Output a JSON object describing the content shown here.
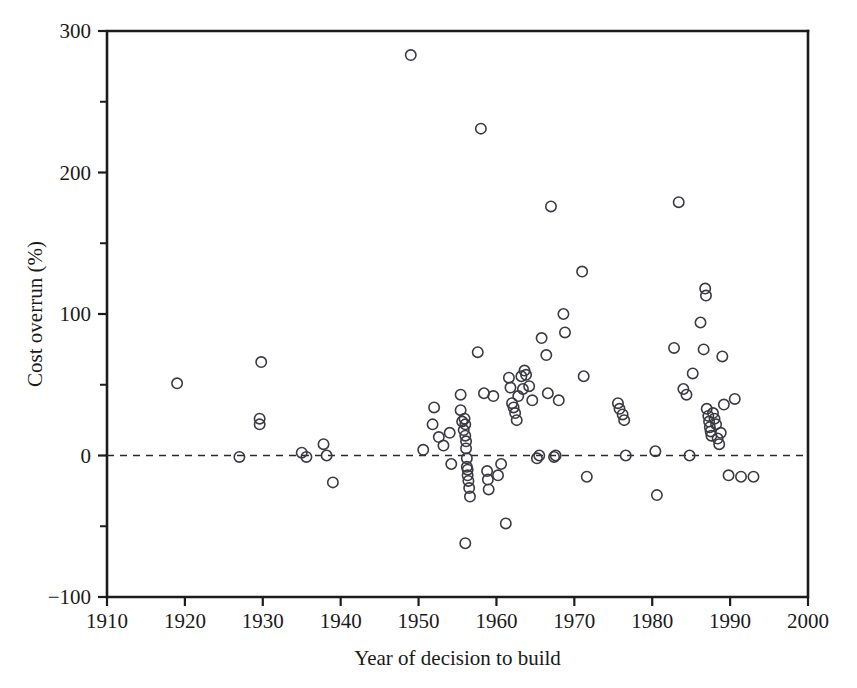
{
  "chart_data": {
    "type": "scatter",
    "title": "",
    "xlabel": "Year of decision to build",
    "ylabel": "Cost overrun (%)",
    "xlim": [
      1910,
      2000
    ],
    "ylim": [
      -100,
      300
    ],
    "xticks": [
      1910,
      1920,
      1930,
      1940,
      1950,
      1960,
      1970,
      1980,
      1990,
      2000
    ],
    "xtick_labels": [
      "1910",
      "1920",
      "1930",
      "1940",
      "1950",
      "1960",
      "1970",
      "1980",
      "1990",
      "2000"
    ],
    "yticks": [
      -100,
      0,
      100,
      200,
      300
    ],
    "ytick_labels": [
      "-100",
      "0",
      "100",
      "200",
      "300"
    ],
    "yticks_minor": [
      -50,
      50,
      150,
      250
    ],
    "grid": false,
    "legend": null,
    "marker": "open-circle",
    "marker_color": "#3a3a42",
    "marker_radius_px": 5.2,
    "reference_lines": [
      {
        "name": "zero-line",
        "axis": "y",
        "value": 0,
        "style": "dashed"
      }
    ],
    "points": [
      [
        1919,
        51
      ],
      [
        1927,
        -1
      ],
      [
        1929.6,
        26
      ],
      [
        1929.6,
        22
      ],
      [
        1929.8,
        66
      ],
      [
        1935,
        2
      ],
      [
        1935.6,
        -1
      ],
      [
        1937.8,
        8
      ],
      [
        1938.2,
        0
      ],
      [
        1939,
        -19
      ],
      [
        1949,
        283
      ],
      [
        1950.6,
        4
      ],
      [
        1951.8,
        22
      ],
      [
        1952,
        34
      ],
      [
        1952.6,
        13
      ],
      [
        1953.2,
        7
      ],
      [
        1954,
        16
      ],
      [
        1954.2,
        -6
      ],
      [
        1955.4,
        43
      ],
      [
        1955.6,
        24
      ],
      [
        1955.8,
        18
      ],
      [
        1955.9,
        26
      ],
      [
        1956.0,
        22
      ],
      [
        1956.0,
        14
      ],
      [
        1956.1,
        10
      ],
      [
        1956.1,
        5
      ],
      [
        1956.2,
        -2
      ],
      [
        1956.2,
        -8
      ],
      [
        1956.3,
        -10
      ],
      [
        1956.3,
        -14
      ],
      [
        1956.4,
        -18
      ],
      [
        1956.5,
        -23
      ],
      [
        1956.6,
        -29
      ],
      [
        1956.0,
        -62
      ],
      [
        1955.4,
        32
      ],
      [
        1957.6,
        73
      ],
      [
        1958,
        231
      ],
      [
        1958.4,
        44
      ],
      [
        1958.8,
        -11
      ],
      [
        1958.9,
        -17
      ],
      [
        1959.0,
        -24
      ],
      [
        1959.6,
        42
      ],
      [
        1960.2,
        -14
      ],
      [
        1960.6,
        -6
      ],
      [
        1961.2,
        -48
      ],
      [
        1961.6,
        55
      ],
      [
        1961.8,
        48
      ],
      [
        1962.0,
        37
      ],
      [
        1962.2,
        34
      ],
      [
        1962.4,
        30
      ],
      [
        1962.6,
        25
      ],
      [
        1962.8,
        42
      ],
      [
        1963.2,
        56
      ],
      [
        1963.4,
        47
      ],
      [
        1963.6,
        60
      ],
      [
        1963.8,
        57
      ],
      [
        1964.2,
        49
      ],
      [
        1964.6,
        39
      ],
      [
        1965.2,
        -2
      ],
      [
        1965.5,
        0
      ],
      [
        1965.8,
        83
      ],
      [
        1966.4,
        71
      ],
      [
        1966.6,
        44
      ],
      [
        1967.0,
        176
      ],
      [
        1967.4,
        -1
      ],
      [
        1967.6,
        0
      ],
      [
        1968.0,
        39
      ],
      [
        1968.6,
        100
      ],
      [
        1968.8,
        87
      ],
      [
        1971.0,
        130
      ],
      [
        1971.2,
        56
      ],
      [
        1971.6,
        -15
      ],
      [
        1975.6,
        37
      ],
      [
        1975.8,
        33
      ],
      [
        1976.2,
        29
      ],
      [
        1976.4,
        25
      ],
      [
        1976.6,
        0
      ],
      [
        1980.4,
        3
      ],
      [
        1980.6,
        -28
      ],
      [
        1982.8,
        76
      ],
      [
        1983.4,
        179
      ],
      [
        1984.0,
        47
      ],
      [
        1984.4,
        43
      ],
      [
        1985.2,
        58
      ],
      [
        1986.2,
        94
      ],
      [
        1986.6,
        75
      ],
      [
        1986.8,
        118
      ],
      [
        1986.9,
        113
      ],
      [
        1987.0,
        33
      ],
      [
        1987.2,
        28
      ],
      [
        1987.3,
        24
      ],
      [
        1987.4,
        20
      ],
      [
        1987.5,
        17
      ],
      [
        1987.6,
        14
      ],
      [
        1987.8,
        30
      ],
      [
        1988.0,
        26
      ],
      [
        1988.2,
        22
      ],
      [
        1988.4,
        12
      ],
      [
        1988.6,
        8
      ],
      [
        1988.8,
        16
      ],
      [
        1989.2,
        36
      ],
      [
        1989.0,
        70
      ],
      [
        1989.8,
        -14
      ],
      [
        1990.6,
        40
      ],
      [
        1991.4,
        -15
      ],
      [
        1993.0,
        -15
      ],
      [
        1984.8,
        0
      ]
    ]
  }
}
